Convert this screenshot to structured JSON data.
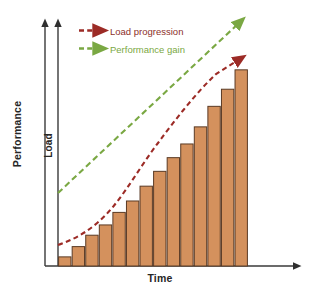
{
  "chart_data": {
    "type": "bar",
    "title": "",
    "xlabel": "Time",
    "ylabel": "Performance",
    "secondary_ylabel": "Load",
    "grid": false,
    "legend_position": "top-left",
    "categories": [
      "1",
      "2",
      "3",
      "4",
      "5",
      "6",
      "7",
      "8",
      "9",
      "10",
      "11",
      "12",
      "13",
      "14"
    ],
    "series": [
      {
        "name": "Load",
        "type": "bar",
        "values": [
          8,
          17,
          27,
          36,
          47,
          57,
          70,
          83,
          95,
          107,
          122,
          140,
          155,
          172
        ],
        "color": "#d4915d",
        "edge_color": "#5a3a24"
      },
      {
        "name": "Load progression",
        "type": "line",
        "style": "dashed",
        "arrow": true,
        "color": "#9c2b26",
        "x": [
          0,
          1.4,
          2.8,
          4.2,
          5.6,
          7.0,
          8.4,
          9.8,
          11.2,
          12.6,
          13.6
        ],
        "values": [
          14,
          26,
          40,
          56,
          74,
          93,
          113,
          134,
          153,
          172,
          190
        ]
      },
      {
        "name": "Performance gain",
        "type": "line",
        "style": "dashed",
        "arrow": true,
        "color": "#7aa843",
        "x": [
          0,
          13.8
        ],
        "values": [
          66,
          228
        ]
      }
    ],
    "ylim": [
      0,
      240
    ],
    "xlim": [
      0,
      14
    ]
  },
  "axes": {
    "performance_label": "Performance",
    "load_label": "Load",
    "time_label": "Time"
  },
  "legend": {
    "items": [
      {
        "label": "Load progression",
        "color": "#9c2b26",
        "marker": "dashed-arrow-icon"
      },
      {
        "label": "Performance gain",
        "color": "#7aa843",
        "marker": "dashed-arrow-icon"
      }
    ]
  },
  "colors": {
    "bar_fill": "#d4915d",
    "bar_edge": "#5a3a24",
    "load_progression": "#9c2b26",
    "performance_gain": "#7aa843",
    "axis": "#3a3a3a",
    "background": "#ffffff"
  }
}
